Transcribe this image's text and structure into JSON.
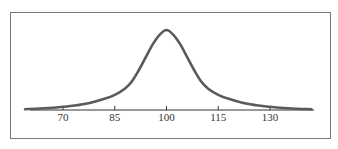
{
  "chart_data": {
    "type": "line",
    "title": "",
    "xlabel": "",
    "ylabel": "",
    "xlim": [
      59,
      142
    ],
    "ylim": [
      0,
      1
    ],
    "grid": false,
    "legend": "none",
    "xticks": [
      70,
      85,
      100,
      115,
      130
    ],
    "xtick_labels": [
      "70",
      "85",
      "100",
      "115",
      "130"
    ],
    "series": [
      {
        "name": "distribution",
        "color": "#5a5a5a",
        "x": [
          59,
          62,
          66,
          70,
          74,
          78,
          82,
          85,
          88,
          90,
          92,
          94,
          96,
          98,
          100,
          102,
          104,
          106,
          108,
          110,
          112,
          115,
          118,
          122,
          126,
          130,
          134,
          138,
          142
        ],
        "y": [
          0.01,
          0.015,
          0.025,
          0.04,
          0.06,
          0.09,
          0.14,
          0.19,
          0.27,
          0.36,
          0.5,
          0.66,
          0.82,
          0.94,
          1.0,
          0.94,
          0.82,
          0.66,
          0.5,
          0.36,
          0.27,
          0.19,
          0.14,
          0.09,
          0.06,
          0.04,
          0.025,
          0.015,
          0.01
        ]
      }
    ]
  }
}
